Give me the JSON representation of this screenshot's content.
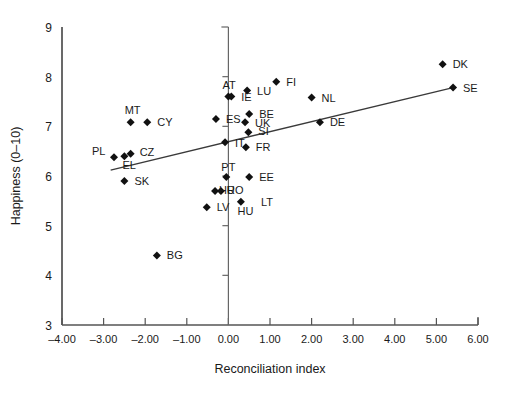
{
  "chart_data": {
    "type": "scatter",
    "title": "",
    "xlabel": "Reconciliation index",
    "ylabel": "Happiness (0–10)",
    "xlim": [
      -4.0,
      6.0
    ],
    "ylim": [
      3,
      9
    ],
    "xticks": [
      "-4.00",
      "-3.00",
      "-2.00",
      "-1.00",
      "0.00",
      "1.00",
      "2.00",
      "3.00",
      "4.00",
      "5.00",
      "6.00"
    ],
    "xtick_values": [
      -4,
      -3,
      -2,
      -1,
      0,
      1,
      2,
      3,
      4,
      5,
      6
    ],
    "yticks": [
      "3",
      "4",
      "5",
      "6",
      "7",
      "8",
      "9"
    ],
    "ytick_values": [
      3,
      4,
      5,
      6,
      7,
      8,
      9
    ],
    "grid": false,
    "legend": "none",
    "marker_shape": "diamond",
    "marker_color": "#111111",
    "points": [
      {
        "label": "DK",
        "x": 5.15,
        "y": 8.25,
        "lx": 10,
        "ly": 4
      },
      {
        "label": "SE",
        "x": 5.4,
        "y": 7.78,
        "lx": 10,
        "ly": 4
      },
      {
        "label": "FI",
        "x": 1.15,
        "y": 7.9,
        "lx": 10,
        "ly": 4
      },
      {
        "label": "NL",
        "x": 2.0,
        "y": 7.58,
        "lx": 10,
        "ly": 4
      },
      {
        "label": "DE",
        "x": 2.2,
        "y": 7.08,
        "lx": 10,
        "ly": 4
      },
      {
        "label": "LU",
        "x": 0.45,
        "y": 7.72,
        "lx": 10,
        "ly": 4
      },
      {
        "label": "AT",
        "x": 0.0,
        "y": 7.6,
        "lx": -6,
        "ly": -8
      },
      {
        "label": "IE",
        "x": 0.07,
        "y": 7.6,
        "lx": 10,
        "ly": 4
      },
      {
        "label": "BE",
        "x": 0.5,
        "y": 7.25,
        "lx": 10,
        "ly": 4
      },
      {
        "label": "UK",
        "x": 0.4,
        "y": 7.08,
        "lx": 10,
        "ly": 5
      },
      {
        "label": "ES",
        "x": -0.3,
        "y": 7.15,
        "lx": 10,
        "ly": 4
      },
      {
        "label": "SI",
        "x": 0.48,
        "y": 6.88,
        "lx": 10,
        "ly": 3
      },
      {
        "label": "IT",
        "x": -0.08,
        "y": 6.68,
        "lx": 10,
        "ly": 5
      },
      {
        "label": "FR",
        "x": 0.42,
        "y": 6.58,
        "lx": 10,
        "ly": 4
      },
      {
        "label": "MT",
        "x": -2.35,
        "y": 7.08,
        "lx": -6,
        "ly": -8
      },
      {
        "label": "CY",
        "x": -1.95,
        "y": 7.08,
        "lx": 10,
        "ly": 4
      },
      {
        "label": "PL",
        "x": -2.75,
        "y": 6.38,
        "lx": -22,
        "ly": -2
      },
      {
        "label": "EL",
        "x": -2.5,
        "y": 6.4,
        "lx": -2,
        "ly": 13
      },
      {
        "label": "CZ",
        "x": -2.35,
        "y": 6.45,
        "lx": 9,
        "ly": 2
      },
      {
        "label": "SK",
        "x": -2.5,
        "y": 5.9,
        "lx": 10,
        "ly": 4
      },
      {
        "label": "PT",
        "x": -0.05,
        "y": 5.98,
        "lx": -5,
        "ly": -6
      },
      {
        "label": "EE",
        "x": 0.5,
        "y": 5.98,
        "lx": 10,
        "ly": 4
      },
      {
        "label": "RO",
        "x": -0.32,
        "y": 5.7,
        "lx": 12,
        "ly": 3
      },
      {
        "label": "HU",
        "x": -0.18,
        "y": 5.7,
        "lx": -2,
        "ly": 3
      },
      {
        "label": "LV",
        "x": -0.52,
        "y": 5.37,
        "lx": 10,
        "ly": 4
      },
      {
        "label": "LT",
        "x": 0.3,
        "y": 5.48,
        "lx": 20,
        "ly": 4
      },
      {
        "label": "BG",
        "x": -1.72,
        "y": 4.4,
        "lx": 10,
        "ly": 4
      }
    ],
    "extra_labels": [
      {
        "label": "HU",
        "x": 0.22,
        "y": 5.22
      }
    ],
    "trendline": {
      "x0": -2.83,
      "y0": 6.12,
      "x1": 5.4,
      "y1": 7.78
    },
    "zero_axis": {
      "x": 0.0,
      "y_top": 9.0,
      "y_bottom": 3.0,
      "inner_ticks": [
        8,
        7,
        6,
        5,
        4
      ]
    }
  }
}
